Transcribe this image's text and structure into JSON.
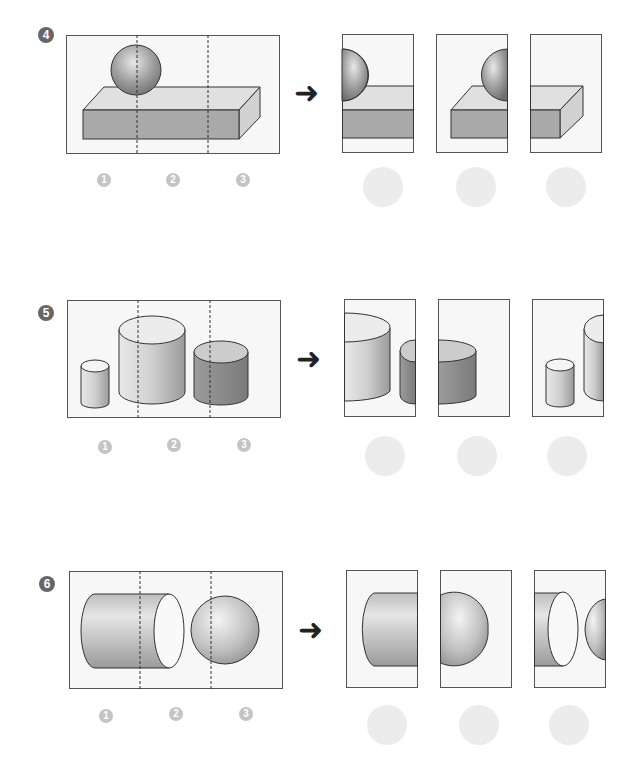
{
  "problems": [
    {
      "number": "4",
      "options": [
        "1",
        "2",
        "3"
      ],
      "description": "Sphere on rectangular box, cut into three vertical strips"
    },
    {
      "number": "5",
      "options": [
        "1",
        "2",
        "3"
      ],
      "description": "Three cylinders of different sizes, cut into three vertical strips"
    },
    {
      "number": "6",
      "options": [
        "1",
        "2",
        "3"
      ],
      "description": "Horizontal cylinder and sphere, cut into three vertical strips"
    }
  ],
  "arrow_glyph": "➜",
  "colors": {
    "frame_stroke": "#555555",
    "frame_fill": "#f7f7f7",
    "shape_stroke": "#333333",
    "badge_dark": "#666666",
    "badge_light": "#c4c4c4",
    "answer_circle": "#ececec"
  }
}
